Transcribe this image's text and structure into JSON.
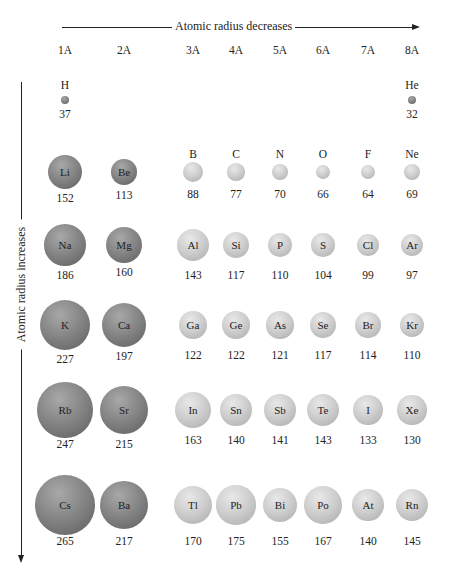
{
  "axes": {
    "horizontal_label": "Atomic radius decreases",
    "vertical_label": "Atomic radius increases"
  },
  "groups": [
    "1A",
    "2A",
    "3A",
    "4A",
    "5A",
    "6A",
    "7A",
    "8A"
  ],
  "units_note": "",
  "elements": [
    {
      "symbol": "H",
      "radius": "37",
      "group": "1A",
      "period": 1,
      "type": "metal"
    },
    {
      "symbol": "He",
      "radius": "32",
      "group": "8A",
      "period": 1,
      "type": "metal"
    },
    {
      "symbol": "Li",
      "radius": "152",
      "group": "1A",
      "period": 2,
      "type": "metal"
    },
    {
      "symbol": "Be",
      "radius": "113",
      "group": "2A",
      "period": 2,
      "type": "metal"
    },
    {
      "symbol": "B",
      "radius": "88",
      "group": "3A",
      "period": 2,
      "type": "nonmetal"
    },
    {
      "symbol": "C",
      "radius": "77",
      "group": "4A",
      "period": 2,
      "type": "nonmetal"
    },
    {
      "symbol": "N",
      "radius": "70",
      "group": "5A",
      "period": 2,
      "type": "nonmetal"
    },
    {
      "symbol": "O",
      "radius": "66",
      "group": "6A",
      "period": 2,
      "type": "nonmetal"
    },
    {
      "symbol": "F",
      "radius": "64",
      "group": "7A",
      "period": 2,
      "type": "nonmetal"
    },
    {
      "symbol": "Ne",
      "radius": "69",
      "group": "8A",
      "period": 2,
      "type": "nonmetal"
    },
    {
      "symbol": "Na",
      "radius": "186",
      "group": "1A",
      "period": 3,
      "type": "metal"
    },
    {
      "symbol": "Mg",
      "radius": "160",
      "group": "2A",
      "period": 3,
      "type": "metal"
    },
    {
      "symbol": "Al",
      "radius": "143",
      "group": "3A",
      "period": 3,
      "type": "nonmetal"
    },
    {
      "symbol": "Si",
      "radius": "117",
      "group": "4A",
      "period": 3,
      "type": "nonmetal"
    },
    {
      "symbol": "P",
      "radius": "110",
      "group": "5A",
      "period": 3,
      "type": "nonmetal"
    },
    {
      "symbol": "S",
      "radius": "104",
      "group": "6A",
      "period": 3,
      "type": "nonmetal"
    },
    {
      "symbol": "Cl",
      "radius": "99",
      "group": "7A",
      "period": 3,
      "type": "nonmetal"
    },
    {
      "symbol": "Ar",
      "radius": "97",
      "group": "8A",
      "period": 3,
      "type": "nonmetal"
    },
    {
      "symbol": "K",
      "radius": "227",
      "group": "1A",
      "period": 4,
      "type": "metal"
    },
    {
      "symbol": "Ca",
      "radius": "197",
      "group": "2A",
      "period": 4,
      "type": "metal"
    },
    {
      "symbol": "Ga",
      "radius": "122",
      "group": "3A",
      "period": 4,
      "type": "nonmetal"
    },
    {
      "symbol": "Ge",
      "radius": "122",
      "group": "4A",
      "period": 4,
      "type": "nonmetal"
    },
    {
      "symbol": "As",
      "radius": "121",
      "group": "5A",
      "period": 4,
      "type": "nonmetal"
    },
    {
      "symbol": "Se",
      "radius": "117",
      "group": "6A",
      "period": 4,
      "type": "nonmetal"
    },
    {
      "symbol": "Br",
      "radius": "114",
      "group": "7A",
      "period": 4,
      "type": "nonmetal"
    },
    {
      "symbol": "Kr",
      "radius": "110",
      "group": "8A",
      "period": 4,
      "type": "nonmetal"
    },
    {
      "symbol": "Rb",
      "radius": "247",
      "group": "1A",
      "period": 5,
      "type": "metal"
    },
    {
      "symbol": "Sr",
      "radius": "215",
      "group": "2A",
      "period": 5,
      "type": "metal"
    },
    {
      "symbol": "In",
      "radius": "163",
      "group": "3A",
      "period": 5,
      "type": "nonmetal"
    },
    {
      "symbol": "Sn",
      "radius": "140",
      "group": "4A",
      "period": 5,
      "type": "nonmetal"
    },
    {
      "symbol": "Sb",
      "radius": "141",
      "group": "5A",
      "period": 5,
      "type": "nonmetal"
    },
    {
      "symbol": "Te",
      "radius": "143",
      "group": "6A",
      "period": 5,
      "type": "nonmetal"
    },
    {
      "symbol": "I",
      "radius": "133",
      "group": "7A",
      "period": 5,
      "type": "nonmetal"
    },
    {
      "symbol": "Xe",
      "radius": "130",
      "group": "8A",
      "period": 5,
      "type": "nonmetal"
    },
    {
      "symbol": "Cs",
      "radius": "265",
      "group": "1A",
      "period": 6,
      "type": "metal"
    },
    {
      "symbol": "Ba",
      "radius": "217",
      "group": "2A",
      "period": 6,
      "type": "metal"
    },
    {
      "symbol": "Tl",
      "radius": "170",
      "group": "3A",
      "period": 6,
      "type": "nonmetal"
    },
    {
      "symbol": "Pb",
      "radius": "175",
      "group": "4A",
      "period": 6,
      "type": "nonmetal"
    },
    {
      "symbol": "Bi",
      "radius": "155",
      "group": "5A",
      "period": 6,
      "type": "nonmetal"
    },
    {
      "symbol": "Po",
      "radius": "167",
      "group": "6A",
      "period": 6,
      "type": "nonmetal"
    },
    {
      "symbol": "At",
      "radius": "140",
      "group": "7A",
      "period": 6,
      "type": "nonmetal"
    },
    {
      "symbol": "Rn",
      "radius": "145",
      "group": "8A",
      "period": 6,
      "type": "nonmetal"
    }
  ],
  "colors": {
    "metal_sphere": "#8a8a8a",
    "nonmetal_sphere": "#cfcfcf",
    "text": "#222222",
    "background": "#ffffff"
  }
}
